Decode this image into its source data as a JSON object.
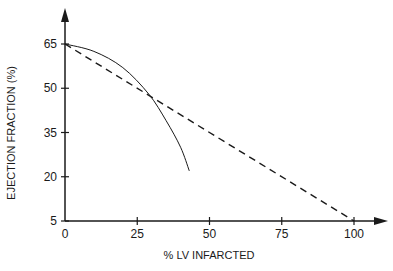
{
  "chart_data": {
    "type": "line",
    "title": "",
    "xlabel": "% LV INFARCTED",
    "ylabel": "EJECTION FRACTION (%)",
    "xlim": [
      0,
      105
    ],
    "ylim": [
      5,
      72
    ],
    "x_ticks": [
      0,
      25,
      50,
      75,
      100
    ],
    "y_ticks": [
      5,
      20,
      35,
      50,
      65
    ],
    "grid": false,
    "legend": null,
    "series": [
      {
        "name": "curve",
        "style": "solid",
        "x": [
          0,
          10,
          20,
          29,
          35,
          40,
          43
        ],
        "y": [
          65,
          62.5,
          57,
          48,
          39,
          30,
          22
        ]
      },
      {
        "name": "linear",
        "style": "dashed",
        "x": [
          0,
          100
        ],
        "y": [
          65,
          5
        ]
      }
    ]
  },
  "colors": {
    "ink": "#1a1a1a",
    "background": "#ffffff"
  }
}
